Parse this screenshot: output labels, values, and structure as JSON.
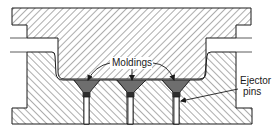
{
  "diagram": {
    "labels": {
      "moldings": "Moldings",
      "ejector_line1": "Ejector",
      "ejector_line2": "pins"
    },
    "parts": [
      {
        "id": "upper-plate",
        "name": "Upper mold (force plug)"
      },
      {
        "id": "lower-plate",
        "name": "Lower mold (cavity block)"
      },
      {
        "id": "molding-1",
        "name": "Molding 1"
      },
      {
        "id": "molding-2",
        "name": "Molding 2"
      },
      {
        "id": "molding-3",
        "name": "Molding 3"
      },
      {
        "id": "ejector-pin-1",
        "name": "Ejector pin 1"
      },
      {
        "id": "ejector-pin-2",
        "name": "Ejector pin 2"
      },
      {
        "id": "ejector-pin-3",
        "name": "Ejector pin 3"
      }
    ],
    "colors": {
      "outline": "#1a1a1a",
      "hatch": "#4a4a4a",
      "molding_fill": "#6e6e6e",
      "plug_fill": "#2e2e2e",
      "background": "#ffffff"
    }
  }
}
